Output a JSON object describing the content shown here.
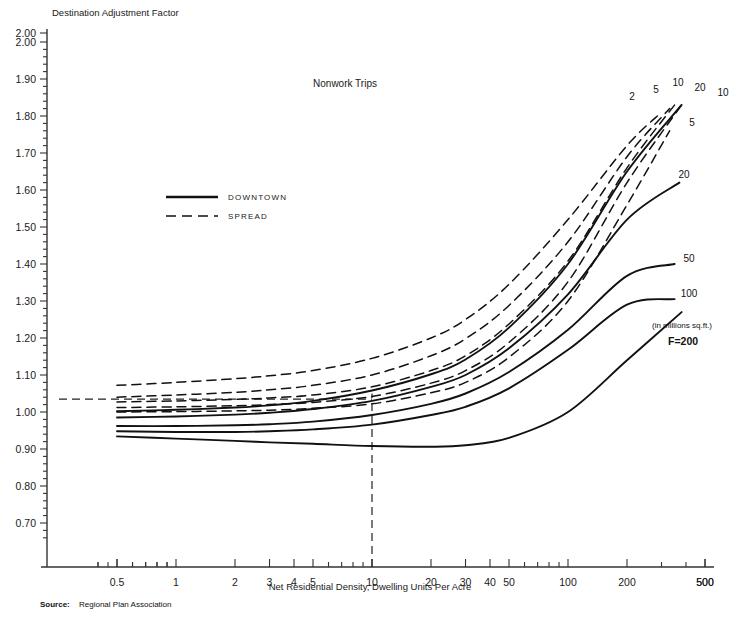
{
  "header": {
    "text": ""
  },
  "chart_data": {
    "type": "line",
    "title": "Nonwork Trips",
    "ylabel": "Destination Adjustment Factor",
    "xlabel": "Net Residential Density, Dwelling Units Per Acre",
    "xscale": "log",
    "xlim": [
      0.38,
      500
    ],
    "ylim": [
      0.65,
      2.0
    ],
    "xticks": [
      0.5,
      1,
      2,
      3,
      4,
      5,
      10,
      20,
      30,
      40,
      50,
      100,
      200,
      500
    ],
    "xticklabels": [
      "0.5",
      "1",
      "2",
      "3",
      "4",
      "5",
      "10",
      "20",
      "30",
      "40",
      "50",
      "100",
      "200",
      "500"
    ],
    "yticks": [
      0.7,
      0.8,
      0.9,
      1.0,
      1.1,
      1.2,
      1.3,
      1.4,
      1.5,
      1.6,
      1.7,
      1.8,
      1.9,
      2.0
    ],
    "yticklabels": [
      "0.70",
      "0.80",
      "0.90",
      "1.00",
      "1.10",
      "1.20",
      "1.30",
      "1.40",
      "1.50",
      "1.60",
      "1.70",
      "1.80",
      "1.90",
      "2.00"
    ],
    "grid": false,
    "legend": [
      {
        "label": "DOWNTOWN",
        "style": "solid"
      },
      {
        "label": "SPREAD",
        "style": "dashed"
      }
    ],
    "annotations": [
      {
        "text": "(in millions sq.ft.)",
        "x": 200,
        "y": 1.145
      },
      {
        "text": "F=200",
        "x": 200,
        "y": 1.085
      }
    ],
    "reference_lines": [
      {
        "orientation": "horizontal",
        "value": 1.035,
        "style": "dashed",
        "from_x": 0.5,
        "to_x": 10
      },
      {
        "orientation": "vertical",
        "value": 10,
        "style": "dashed",
        "from_y": 0.65,
        "to_y": 1.05
      }
    ],
    "series": [
      {
        "name": "SPREAD F=2",
        "label": "2",
        "style": "dashed",
        "points": [
          [
            0.5,
            1.072
          ],
          [
            1,
            1.08
          ],
          [
            2,
            1.09
          ],
          [
            3,
            1.098
          ],
          [
            5,
            1.112
          ],
          [
            10,
            1.145
          ],
          [
            20,
            1.2
          ],
          [
            30,
            1.25
          ],
          [
            50,
            1.345
          ],
          [
            100,
            1.52
          ],
          [
            200,
            1.72
          ],
          [
            300,
            1.81
          ]
        ]
      },
      {
        "name": "SPREAD F=5",
        "label": "5",
        "style": "dashed",
        "points": [
          [
            0.5,
            1.04
          ],
          [
            1,
            1.046
          ],
          [
            2,
            1.053
          ],
          [
            3,
            1.06
          ],
          [
            5,
            1.072
          ],
          [
            10,
            1.1
          ],
          [
            20,
            1.152
          ],
          [
            30,
            1.198
          ],
          [
            50,
            1.288
          ],
          [
            100,
            1.46
          ],
          [
            200,
            1.69
          ],
          [
            330,
            1.82
          ]
        ]
      },
      {
        "name": "SPREAD F=10",
        "label": "10",
        "style": "dashed",
        "points": [
          [
            0.5,
            1.027
          ],
          [
            1,
            1.03
          ],
          [
            2,
            1.034
          ],
          [
            3,
            1.038
          ],
          [
            5,
            1.046
          ],
          [
            10,
            1.068
          ],
          [
            20,
            1.112
          ],
          [
            30,
            1.152
          ],
          [
            50,
            1.238
          ],
          [
            100,
            1.408
          ],
          [
            200,
            1.66
          ],
          [
            350,
            1.83
          ]
        ]
      },
      {
        "name": "SPREAD F=20",
        "label": "20",
        "style": "dashed",
        "points": [
          [
            0.5,
            1.012
          ],
          [
            1,
            1.014
          ],
          [
            2,
            1.017
          ],
          [
            3,
            1.02
          ],
          [
            5,
            1.026
          ],
          [
            10,
            1.042
          ],
          [
            20,
            1.078
          ],
          [
            30,
            1.112
          ],
          [
            50,
            1.188
          ],
          [
            100,
            1.352
          ],
          [
            200,
            1.62
          ],
          [
            380,
            1.83
          ]
        ]
      },
      {
        "name": "SPREAD F=5 lower",
        "label": "5",
        "style": "dashed",
        "points": [
          [
            0.5,
            1.0
          ],
          [
            1,
            1.001
          ],
          [
            2,
            1.003
          ],
          [
            3,
            1.005
          ],
          [
            5,
            1.01
          ],
          [
            10,
            1.022
          ],
          [
            20,
            1.052
          ],
          [
            30,
            1.08
          ],
          [
            50,
            1.148
          ],
          [
            100,
            1.3
          ],
          [
            200,
            1.56
          ],
          [
            330,
            1.76
          ]
        ]
      },
      {
        "name": "DOWNTOWN F=10",
        "label": "10",
        "style": "solid",
        "points": [
          [
            0.5,
            1.002
          ],
          [
            1,
            1.006
          ],
          [
            2,
            1.012
          ],
          [
            3,
            1.018
          ],
          [
            5,
            1.03
          ],
          [
            10,
            1.058
          ],
          [
            20,
            1.102
          ],
          [
            30,
            1.142
          ],
          [
            50,
            1.228
          ],
          [
            100,
            1.4
          ],
          [
            200,
            1.65
          ],
          [
            380,
            1.83
          ]
        ]
      },
      {
        "name": "DOWNTOWN F=20",
        "label": "20",
        "style": "solid",
        "points": [
          [
            0.5,
            0.985
          ],
          [
            1,
            0.988
          ],
          [
            2,
            0.993
          ],
          [
            3,
            0.998
          ],
          [
            5,
            1.008
          ],
          [
            10,
            1.03
          ],
          [
            20,
            1.068
          ],
          [
            30,
            1.1
          ],
          [
            50,
            1.172
          ],
          [
            100,
            1.318
          ],
          [
            200,
            1.52
          ],
          [
            370,
            1.62
          ]
        ]
      },
      {
        "name": "DOWNTOWN F=50",
        "label": "50",
        "style": "solid",
        "points": [
          [
            0.5,
            0.962
          ],
          [
            1,
            0.962
          ],
          [
            2,
            0.964
          ],
          [
            3,
            0.967
          ],
          [
            5,
            0.974
          ],
          [
            10,
            0.992
          ],
          [
            20,
            1.022
          ],
          [
            30,
            1.05
          ],
          [
            50,
            1.108
          ],
          [
            100,
            1.222
          ],
          [
            200,
            1.368
          ],
          [
            350,
            1.4
          ]
        ]
      },
      {
        "name": "DOWNTOWN F=100",
        "label": "100",
        "style": "solid",
        "points": [
          [
            0.5,
            0.948
          ],
          [
            1,
            0.946
          ],
          [
            2,
            0.946
          ],
          [
            3,
            0.948
          ],
          [
            5,
            0.953
          ],
          [
            10,
            0.966
          ],
          [
            20,
            0.992
          ],
          [
            30,
            1.014
          ],
          [
            50,
            1.064
          ],
          [
            100,
            1.168
          ],
          [
            200,
            1.29
          ],
          [
            350,
            1.305
          ]
        ]
      },
      {
        "name": "DOWNTOWN F=200",
        "label": "200",
        "style": "solid",
        "points": [
          [
            0.5,
            0.934
          ],
          [
            1,
            0.928
          ],
          [
            2,
            0.922
          ],
          [
            3,
            0.918
          ],
          [
            5,
            0.914
          ],
          [
            10,
            0.908
          ],
          [
            20,
            0.906
          ],
          [
            30,
            0.91
          ],
          [
            50,
            0.93
          ],
          [
            100,
            1.0
          ],
          [
            200,
            1.14
          ],
          [
            380,
            1.27
          ]
        ]
      }
    ],
    "curve_labels": [
      {
        "text": "2",
        "px": 632,
        "py": 100
      },
      {
        "text": "5",
        "px": 656,
        "py": 93
      },
      {
        "text": "10",
        "px": 678,
        "py": 86
      },
      {
        "text": "20",
        "px": 700,
        "py": 91
      },
      {
        "text": "10",
        "px": 723,
        "py": 96
      },
      {
        "text": "5",
        "px": 692,
        "py": 126
      },
      {
        "text": "20",
        "px": 684,
        "py": 178
      },
      {
        "text": "50",
        "px": 689,
        "py": 262
      },
      {
        "text": "100",
        "px": 689,
        "py": 297
      },
      {
        "text": "200",
        "px": 0,
        "py": 0
      }
    ]
  },
  "source": {
    "key": "Source:",
    "value": "Regional Plan Association"
  }
}
